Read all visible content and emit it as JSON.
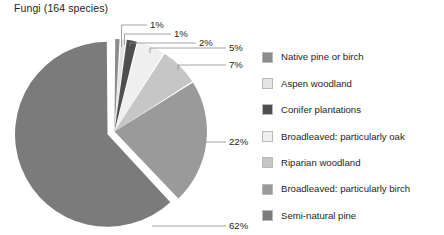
{
  "chart_data": {
    "type": "pie",
    "title": "Fungi (164 species)",
    "total_species": 164,
    "unit": "%",
    "exploded_slice": "Semi-natural pine",
    "start_angle_deg": 0,
    "direction": "clockwise",
    "legend_position": "right",
    "grid": false,
    "categories": [
      "Native pine or birch",
      "Aspen woodland",
      "Conifer plantations",
      "Broadleaved: particularly oak",
      "Riparian woodland",
      "Broadleaved: particularly birch",
      "Semi-natural pine"
    ],
    "values": [
      1,
      1,
      2,
      5,
      7,
      22,
      62
    ],
    "labels": [
      "1%",
      "1%",
      "2%",
      "5%",
      "7%",
      "22%",
      "62%"
    ],
    "colors": [
      "#8c8c8c",
      "#e4e4e4",
      "#4f4f4f",
      "#efefef",
      "#c6c6c6",
      "#9a9a9a",
      "#7b7b7b"
    ]
  },
  "chart": {
    "title": "Fungi (164 species)"
  },
  "callouts": [
    {
      "label": "1%"
    },
    {
      "label": "1%"
    },
    {
      "label": "2%"
    },
    {
      "label": "5%"
    },
    {
      "label": "7%"
    },
    {
      "label": "22%"
    },
    {
      "label": "62%"
    }
  ],
  "legend": {
    "items": [
      {
        "label": "Native pine or birch",
        "color": "#8c8c8c"
      },
      {
        "label": "Aspen woodland",
        "color": "#e4e4e4"
      },
      {
        "label": "Conifer plantations",
        "color": "#4f4f4f"
      },
      {
        "label": "Broadleaved: particularly oak",
        "color": "#efefef"
      },
      {
        "label": "Riparian woodland",
        "color": "#c6c6c6"
      },
      {
        "label": "Broadleaved: particularly birch",
        "color": "#9a9a9a"
      },
      {
        "label": "Semi-natural pine",
        "color": "#7b7b7b"
      }
    ]
  }
}
